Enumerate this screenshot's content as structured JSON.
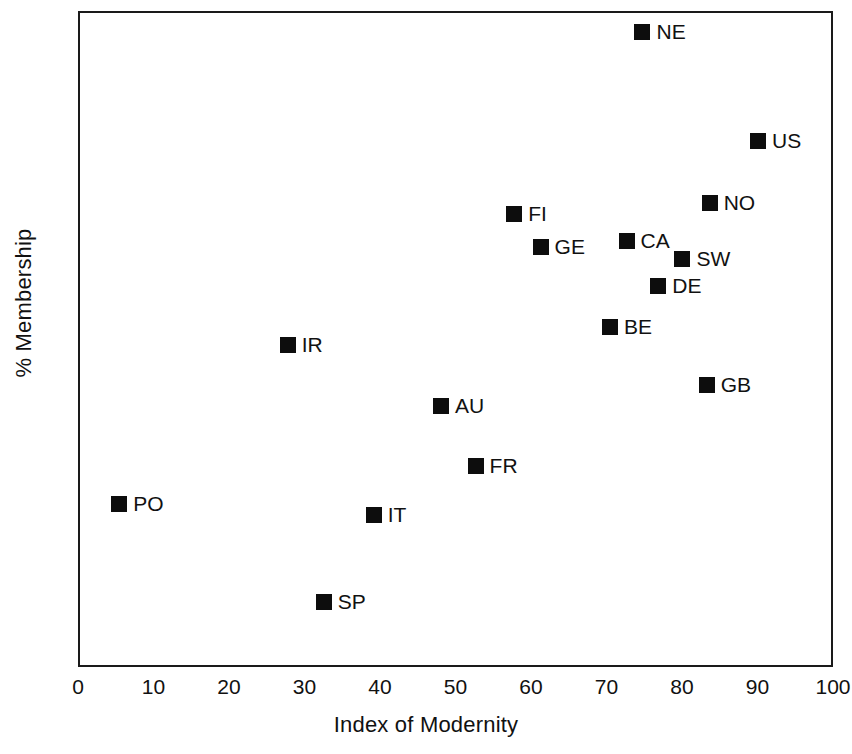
{
  "chart_data": {
    "type": "scatter",
    "title": "",
    "xlabel": "Index of Modernity",
    "ylabel": "% Membership",
    "xlim": [
      0,
      100
    ],
    "ylim": [
      10,
      80
    ],
    "xticks": [
      0,
      10,
      20,
      30,
      40,
      50,
      60,
      70,
      80,
      90,
      100
    ],
    "yticks": [
      10,
      20,
      30,
      40,
      50,
      60,
      70,
      80
    ],
    "xtick_labels": [
      "0",
      "10",
      "20",
      "30",
      "40",
      "50",
      "60",
      "70",
      "80",
      "90",
      "100"
    ],
    "ytick_labels": [
      "10",
      "20",
      "30",
      "40",
      "50",
      "60",
      "70",
      "80"
    ],
    "grid": false,
    "legend": "none",
    "marker_style": "filled-square",
    "marker_color": "#0d0d0d",
    "points": [
      {
        "label": "NE",
        "x": 74.5,
        "y": 78.0
      },
      {
        "label": "US",
        "x": 89.8,
        "y": 66.3
      },
      {
        "label": "NO",
        "x": 83.4,
        "y": 59.7
      },
      {
        "label": "FI",
        "x": 57.5,
        "y": 58.6
      },
      {
        "label": "CA",
        "x": 72.4,
        "y": 55.7
      },
      {
        "label": "GE",
        "x": 61.0,
        "y": 55.0
      },
      {
        "label": "SW",
        "x": 79.8,
        "y": 53.7
      },
      {
        "label": "DE",
        "x": 76.6,
        "y": 50.9
      },
      {
        "label": "BE",
        "x": 70.2,
        "y": 46.5
      },
      {
        "label": "IR",
        "x": 27.5,
        "y": 44.6
      },
      {
        "label": "GB",
        "x": 83.0,
        "y": 40.3
      },
      {
        "label": "AU",
        "x": 47.8,
        "y": 38.1
      },
      {
        "label": "FR",
        "x": 52.4,
        "y": 31.7
      },
      {
        "label": "PO",
        "x": 5.2,
        "y": 27.6
      },
      {
        "label": "IT",
        "x": 38.9,
        "y": 26.4
      },
      {
        "label": "SP",
        "x": 32.3,
        "y": 17.2
      }
    ]
  }
}
